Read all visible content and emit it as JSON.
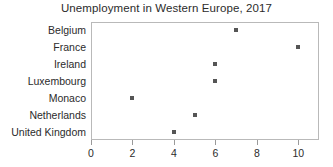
{
  "chart_data": {
    "type": "scatter",
    "title": "Unemployment in Western Europe, 2017",
    "xlabel": "",
    "ylabel": "",
    "orientation": "horizontal",
    "categories": [
      "Belgium",
      "France",
      "Ireland",
      "Luxembourg",
      "Monaco",
      "Netherlands",
      "United Kingdom"
    ],
    "values": [
      7,
      10,
      6,
      6,
      2,
      5,
      4
    ],
    "points": [
      {
        "category": "Belgium",
        "value": 7
      },
      {
        "category": "France",
        "value": 10
      },
      {
        "category": "Ireland",
        "value": 6
      },
      {
        "category": "Luxembourg",
        "value": 6
      },
      {
        "category": "Monaco",
        "value": 2
      },
      {
        "category": "Netherlands",
        "value": 5
      },
      {
        "category": "United Kingdom",
        "value": 4
      }
    ],
    "xlim": [
      0,
      11
    ],
    "xticks": [
      0,
      2,
      4,
      6,
      8,
      10
    ],
    "xtick_labels": [
      "0",
      "2",
      "4",
      "6",
      "8",
      "10"
    ],
    "grid": false,
    "legend": false,
    "marker": "square",
    "marker_color": "#555555",
    "frame_color": "#b9b9b9",
    "text_color": "#2b2b2b",
    "background_color": "#ffffff"
  }
}
